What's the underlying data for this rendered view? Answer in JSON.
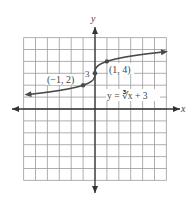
{
  "figure": {
    "type": "function-graph",
    "axis_labels": {
      "x": "x",
      "y": "y"
    },
    "grid": {
      "xmin": -6,
      "xmax": 6,
      "ymin": -6,
      "ymax": 6,
      "step": 1
    },
    "function": {
      "equation": "y = ∛x + 3",
      "expression": "cbrt(x) + 3"
    },
    "labeled_points": [
      {
        "label": "(−1, 2)",
        "x": -1,
        "y": 2
      },
      {
        "label": "(1, 4)",
        "x": 1,
        "y": 4
      }
    ],
    "y_intercept_label": "3",
    "colors": {
      "grid": "#9a9a9a",
      "axes": "#333333",
      "curve": "#4a4a4a",
      "text": "#444444"
    }
  }
}
